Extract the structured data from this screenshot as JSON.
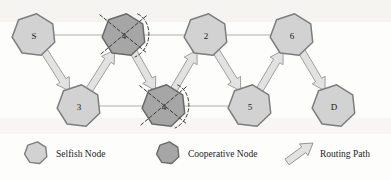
{
  "figure": {
    "type": "network-routing-diagram",
    "background_color": "#fdfdfc"
  },
  "colors": {
    "selfish_node_fill": "#d2d2d2",
    "selfish_node_stroke": "#7d7d7d",
    "cooperative_node_fill": "#a6a6a6",
    "cooperative_node_stroke": "#6a6a6a",
    "arrow_fill": "#e2e2e2",
    "arrow_stroke": "#8a8a8a",
    "link_line": "#8d8d8d",
    "mark_stroke": "#3a3a3a",
    "text": "#1a1a1a"
  },
  "nodes": [
    {
      "id": "S",
      "label": "S",
      "type": "selfish",
      "x": 34,
      "y": 35,
      "r": 22
    },
    {
      "id": "T4",
      "label": "4",
      "type": "cooperative",
      "x": 124,
      "y": 35,
      "r": 22
    },
    {
      "id": "N2",
      "label": "2",
      "type": "selfish",
      "x": 206,
      "y": 35,
      "r": 22
    },
    {
      "id": "N6",
      "label": "6",
      "type": "selfish",
      "x": 292,
      "y": 35,
      "r": 22
    },
    {
      "id": "N3",
      "label": "3",
      "type": "selfish",
      "x": 79,
      "y": 106,
      "r": 22
    },
    {
      "id": "B4",
      "label": "4",
      "type": "cooperative",
      "x": 164,
      "y": 106,
      "r": 22
    },
    {
      "id": "N5",
      "label": "5",
      "type": "selfish",
      "x": 250,
      "y": 106,
      "r": 22
    },
    {
      "id": "D",
      "label": "D",
      "type": "selfish",
      "x": 334,
      "y": 106,
      "r": 22
    }
  ],
  "links": [
    {
      "from": "S",
      "to": "T4",
      "style": "thin-line"
    },
    {
      "from": "T4",
      "to": "N2",
      "style": "thin-line"
    },
    {
      "from": "N2",
      "to": "N6",
      "style": "thin-line"
    },
    {
      "from": "N3",
      "to": "B4",
      "style": "thin-line"
    },
    {
      "from": "B4",
      "to": "N5",
      "style": "thin-line"
    }
  ],
  "routing_path": {
    "label": "Routing Path",
    "sequence": [
      "S",
      "3",
      "4",
      "4",
      "2",
      "5",
      "6",
      "D"
    ],
    "arrows": [
      {
        "from": "S",
        "to": "N3",
        "direction": "down-right"
      },
      {
        "from": "N3",
        "to": "T4",
        "direction": "up-right"
      },
      {
        "from": "T4",
        "to": "B4",
        "direction": "down-right"
      },
      {
        "from": "B4",
        "to": "N2",
        "direction": "up-right"
      },
      {
        "from": "N2",
        "to": "N5",
        "direction": "down-right"
      },
      {
        "from": "N5",
        "to": "N6",
        "direction": "up-right"
      },
      {
        "from": "N6",
        "to": "D",
        "direction": "down-right"
      }
    ]
  },
  "blocked_markers": [
    {
      "on": "T4",
      "kind": "dashed-cross-and-arc"
    },
    {
      "on": "B4",
      "kind": "dashed-cross-and-arc"
    }
  ],
  "legend": {
    "items": [
      {
        "key": "selfish",
        "symbol": "heptagon",
        "label": "Selfish Node",
        "x": 36,
        "y": 153
      },
      {
        "key": "cooperative",
        "symbol": "heptagon",
        "label": "Cooperative Node",
        "x": 168,
        "y": 153
      },
      {
        "key": "routing",
        "symbol": "block-arrow",
        "label": "Routing Path",
        "x": 300,
        "y": 153
      }
    ]
  }
}
